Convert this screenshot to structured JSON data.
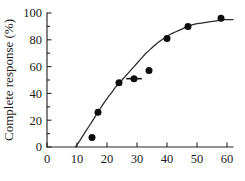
{
  "chart_data": {
    "type": "scatter",
    "title": "",
    "subtitle": "",
    "xlabel": "",
    "ylabel": "Complete response (%)",
    "xlim": [
      0,
      62
    ],
    "ylim": [
      0,
      100
    ],
    "xticks": [
      0,
      10,
      20,
      30,
      40,
      50,
      60
    ],
    "yticks": [
      0,
      20,
      40,
      60,
      80,
      100
    ],
    "xticklabels": [
      "0",
      "10",
      "20",
      "30",
      "40",
      "50",
      "60"
    ],
    "yticklabels": [
      "0",
      "20",
      "40",
      "60",
      "80",
      "100"
    ],
    "grid": false,
    "legend": null,
    "legend_position": "none",
    "series": [
      {
        "name": "Observed complete response",
        "marker": "filled-circle",
        "color": "#0d0d0d",
        "points": [
          {
            "x": 15,
            "y": 7
          },
          {
            "x": 17,
            "y": 26
          },
          {
            "x": 24,
            "y": 48
          },
          {
            "x": 29,
            "y": 51
          },
          {
            "x": 34,
            "y": 57
          },
          {
            "x": 40,
            "y": 81
          },
          {
            "x": 47,
            "y": 90
          },
          {
            "x": 58,
            "y": 96
          }
        ]
      },
      {
        "name": "Fitted sigmoid curve",
        "marker": "line",
        "color": "#2b2b2b",
        "points": [
          {
            "x": 9.5,
            "y": 0
          },
          {
            "x": 11,
            "y": 5
          },
          {
            "x": 13,
            "y": 12
          },
          {
            "x": 15,
            "y": 19
          },
          {
            "x": 17,
            "y": 26
          },
          {
            "x": 19,
            "y": 33
          },
          {
            "x": 21,
            "y": 39
          },
          {
            "x": 23,
            "y": 45
          },
          {
            "x": 25,
            "y": 50
          },
          {
            "x": 27,
            "y": 55
          },
          {
            "x": 29,
            "y": 60
          },
          {
            "x": 31,
            "y": 65
          },
          {
            "x": 33,
            "y": 70
          },
          {
            "x": 35,
            "y": 74
          },
          {
            "x": 37,
            "y": 78
          },
          {
            "x": 39,
            "y": 81
          },
          {
            "x": 41,
            "y": 84
          },
          {
            "x": 43,
            "y": 86
          },
          {
            "x": 45,
            "y": 88
          },
          {
            "x": 47,
            "y": 90
          },
          {
            "x": 50,
            "y": 92
          },
          {
            "x": 53,
            "y": 93
          },
          {
            "x": 56,
            "y": 94
          },
          {
            "x": 59,
            "y": 95
          },
          {
            "x": 62,
            "y": 95
          }
        ]
      }
    ],
    "annotations": [
      {
        "name": "median-marker",
        "type": "horizontal-bar",
        "x": 29,
        "y": 51,
        "half_width": 2.6
      }
    ]
  }
}
